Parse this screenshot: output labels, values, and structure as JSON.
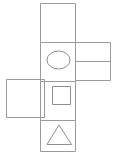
{
  "figure": {
    "background_color": "#ffffff",
    "stroke_color": "#9a9a9a",
    "symbol_stroke_color": "#8f8f8f",
    "stroke_width": 1,
    "width": 118,
    "height": 159
  },
  "faces": [
    {
      "name": "top-blank-face",
      "label": "",
      "symbol": "none",
      "x": 40.5,
      "y": 3.5,
      "width": 35,
      "height": 39
    },
    {
      "name": "ellipse-face",
      "label": "",
      "symbol": "ellipse",
      "x": 40.5,
      "y": 42.5,
      "width": 35,
      "height": 39
    },
    {
      "name": "square-face",
      "label": "",
      "symbol": "square",
      "x": 40.5,
      "y": 81.5,
      "width": 35,
      "height": 39
    },
    {
      "name": "triangle-face",
      "label": "",
      "symbol": "triangle",
      "x": 40.5,
      "y": 120.5,
      "width": 35,
      "height": 31
    }
  ],
  "flaps": [
    {
      "name": "right-flap",
      "label": "",
      "x": 75.5,
      "y": 42.5,
      "width": 35,
      "height": 38,
      "divider_y": 61.5,
      "has_divider": true
    },
    {
      "name": "left-flap",
      "label": "",
      "x": 6.5,
      "y": 79.5,
      "width": 38,
      "height": 38,
      "has_divider": false
    }
  ],
  "symbols": {
    "ellipse": {
      "name": "ellipse-symbol",
      "cx": 58.5,
      "cy": 60,
      "rx": 11.5,
      "ry": 9
    },
    "square": {
      "name": "square-symbol",
      "x": 52.5,
      "y": 86.5,
      "width": 18,
      "height": 18
    },
    "triangle": {
      "name": "triangle-symbol",
      "points": "59,125 71.5,144.5 47,144.5"
    }
  }
}
